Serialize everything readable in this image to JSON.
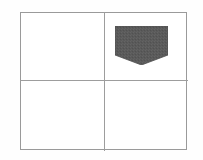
{
  "figure": {
    "title": "",
    "background_color": "#ffffff",
    "frame": {
      "border_color": "#9a9a9a",
      "fill_color": "#ffffff",
      "divider_color": "#9d9d9d"
    }
  },
  "grid": {
    "rows": 2,
    "columns": 2,
    "quadrants": [
      {
        "id": "top-left",
        "label": "",
        "filled": false,
        "content": ""
      },
      {
        "id": "top-right",
        "label": "",
        "filled": true,
        "content": "shaded-pentagon"
      },
      {
        "id": "bottom-left",
        "label": "",
        "filled": false,
        "content": ""
      },
      {
        "id": "bottom-right",
        "label": "",
        "filled": false,
        "content": ""
      }
    ]
  },
  "marker": {
    "shape_name": "pentagon-shield-down",
    "quadrant": "top-right",
    "fill_color": "#5a5a5a",
    "stroke_color": "#4e4e4e",
    "texture": "noise-dither"
  }
}
